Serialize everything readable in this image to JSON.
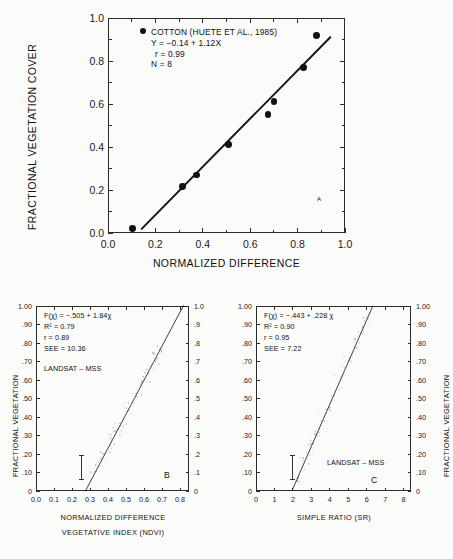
{
  "chart_data": [
    {
      "type": "scatter",
      "panel_id": "A",
      "title": "",
      "xlabel": "NORMALIZED DIFFERENCE",
      "ylabel": "FRACTIONAL VEGETATION COVER",
      "xlim": [
        0.0,
        1.0
      ],
      "ylim": [
        0.0,
        1.0
      ],
      "xticks": [
        "0.0",
        "0.2",
        "0.4",
        "0.6",
        "0.8",
        "1.0"
      ],
      "yticks": [
        "0.0",
        "0.2",
        "0.4",
        "0.6",
        "0.8",
        "1.0"
      ],
      "xtick_values": [
        0.0,
        0.2,
        0.4,
        0.6,
        0.8,
        1.0
      ],
      "ytick_values": [
        0.0,
        0.2,
        0.4,
        0.6,
        0.8,
        1.0
      ],
      "grid": false,
      "legend_marker": "filled-circle",
      "legend_label": "COTTON (HUETE ET AL., 1985)",
      "annotations": [
        "Y = −0.14 + 1.12X",
        "r = 0.99",
        "N = 8"
      ],
      "equation": "Y = -0.14 + 1.12X",
      "r": 0.99,
      "n": 8,
      "fit_line": {
        "slope": 1.12,
        "intercept": -0.14,
        "x_start": 0.14,
        "x_end": 0.94
      },
      "points": [
        {
          "x": 0.105,
          "y": 0.02
        },
        {
          "x": 0.315,
          "y": 0.215
        },
        {
          "x": 0.375,
          "y": 0.27
        },
        {
          "x": 0.51,
          "y": 0.41
        },
        {
          "x": 0.675,
          "y": 0.55
        },
        {
          "x": 0.7,
          "y": 0.61
        },
        {
          "x": 0.825,
          "y": 0.77
        },
        {
          "x": 0.88,
          "y": 0.92
        }
      ]
    },
    {
      "type": "scatter",
      "panel_id": "B",
      "title": "",
      "xlabel_line1": "NORMALIZED DIFFERENCE",
      "xlabel_line2": "VEGETATIVE INDEX (NDVI)",
      "ylabel": "FRACTIONAL VEGETATION",
      "ylabel_right": "",
      "xlim": [
        0.0,
        0.85
      ],
      "ylim": [
        0.0,
        1.0
      ],
      "xticks": [
        "0.0",
        "0.1",
        "0.2",
        "0.3",
        "0.4",
        "0.5",
        "0.6",
        "0.7",
        "0.8"
      ],
      "xtick_values": [
        0.0,
        0.1,
        0.2,
        0.3,
        0.4,
        0.5,
        0.6,
        0.7,
        0.8
      ],
      "yticks": [
        "1.00",
        ".90",
        ".80",
        ".70",
        ".60",
        ".50",
        ".40",
        ".30",
        ".20",
        ".10",
        "0"
      ],
      "ytick_values": [
        1.0,
        0.9,
        0.8,
        0.7,
        0.6,
        0.5,
        0.4,
        0.3,
        0.2,
        0.1,
        0.0
      ],
      "yticks_right": [
        "1.0",
        ".9",
        ".8",
        ".7",
        ".6",
        ".5",
        ".4",
        ".3",
        ".2",
        ".1",
        "0"
      ],
      "grid": false,
      "annotations": [
        "F(χ) = −.505 + 1.84χ",
        "R² = 0.79",
        "r = 0.89",
        "SEE = 10.36"
      ],
      "equation": "F(x) = -.505 + 1.84x",
      "r_squared": 0.79,
      "r": 0.89,
      "see": 10.36,
      "sensor_label": "LANDSAT – MSS",
      "fit_line": {
        "slope": 1.84,
        "intercept": -0.505,
        "x_start": 0.274,
        "x_end": 0.82
      },
      "error_bar": {
        "x": 0.25,
        "y_low": 0.065,
        "y_high": 0.195
      },
      "cloud": {
        "description": "dense faint scatter cloud along regression line",
        "x_range": [
          0.3,
          0.7
        ],
        "y_range": [
          0.1,
          1.0
        ],
        "n_points": 120
      }
    },
    {
      "type": "scatter",
      "panel_id": "C",
      "title": "",
      "xlabel": "SIMPLE RATIO (SR)",
      "ylabel": "",
      "ylabel_right": "FRACTIONAL VEGETATION",
      "xlim": [
        0,
        8.4
      ],
      "ylim": [
        0.0,
        1.0
      ],
      "xticks": [
        "0",
        "1",
        "2",
        "3",
        "4",
        "5",
        "6",
        "7",
        "8"
      ],
      "xtick_values": [
        0,
        1,
        2,
        3,
        4,
        5,
        6,
        7,
        8
      ],
      "yticks": [
        "1.00",
        ".90",
        ".80",
        ".70",
        ".60",
        ".50",
        ".40",
        ".30",
        ".20",
        ".10",
        "0"
      ],
      "ytick_values": [
        1.0,
        0.9,
        0.8,
        0.7,
        0.6,
        0.5,
        0.4,
        0.3,
        0.2,
        0.1,
        0.0
      ],
      "yticks_right": [
        "1.00",
        ".90",
        ".80",
        ".70",
        ".60",
        ".50",
        ".40",
        ".30",
        ".20",
        ".10",
        "0"
      ],
      "grid": false,
      "annotations": [
        "F(χ) = −.443 + .228 χ",
        "R² = 0.90",
        "r = 0.95",
        "SEE = 7.22"
      ],
      "equation": "F(x) = -.443 + .228x",
      "r_squared": 0.9,
      "r": 0.95,
      "see": 7.22,
      "sensor_label": "LANDSAT – MSS",
      "fit_line": {
        "slope": 0.228,
        "intercept": -0.443,
        "x_start": 1.95,
        "x_end": 6.33
      },
      "error_bar": {
        "x": 2.0,
        "y_low": 0.065,
        "y_high": 0.195
      },
      "cloud": {
        "description": "dense faint scatter cloud along regression line",
        "x_range": [
          2.2,
          6.2
        ],
        "y_range": [
          0.05,
          1.0
        ],
        "n_points": 120
      }
    }
  ]
}
